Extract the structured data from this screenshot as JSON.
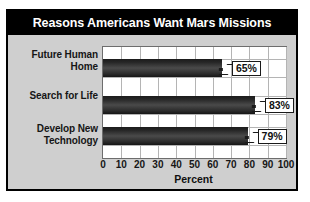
{
  "chart_data": {
    "type": "bar",
    "orientation": "horizontal",
    "title": "Reasons Americans Want Mars Missions",
    "xlabel": "Percent",
    "ylabel": "",
    "categories": [
      "Future Human Home",
      "Search for Life",
      "Develop New Technology"
    ],
    "values": [
      65,
      83,
      79
    ],
    "data_labels": [
      "65%",
      "83%",
      "79%"
    ],
    "xlim": [
      0,
      100
    ],
    "xticks": [
      0,
      10,
      20,
      30,
      40,
      50,
      60,
      70,
      80,
      90,
      100
    ],
    "xtick_labels": [
      "0",
      "10",
      "20",
      "30",
      "40",
      "50",
      "60",
      "70",
      "80",
      "90",
      "100"
    ],
    "grid": "vertical-and-horizontal",
    "legend": "none",
    "colors": {
      "title_bar_background": "#000000",
      "title_text": "#ffffff",
      "panel_background": "#cfcfcf",
      "plot_background": "#ffffff",
      "bar_fill": "#2e2e2e",
      "gridline": "#b4b4b4",
      "frame_border": "#000000",
      "label_text": "#161616"
    }
  },
  "categories_display": [
    {
      "line1": "Future Human",
      "line2": "Home"
    },
    {
      "line1": "Search for Life",
      "line2": ""
    },
    {
      "line1": "Develop New",
      "line2": "Technology"
    }
  ]
}
